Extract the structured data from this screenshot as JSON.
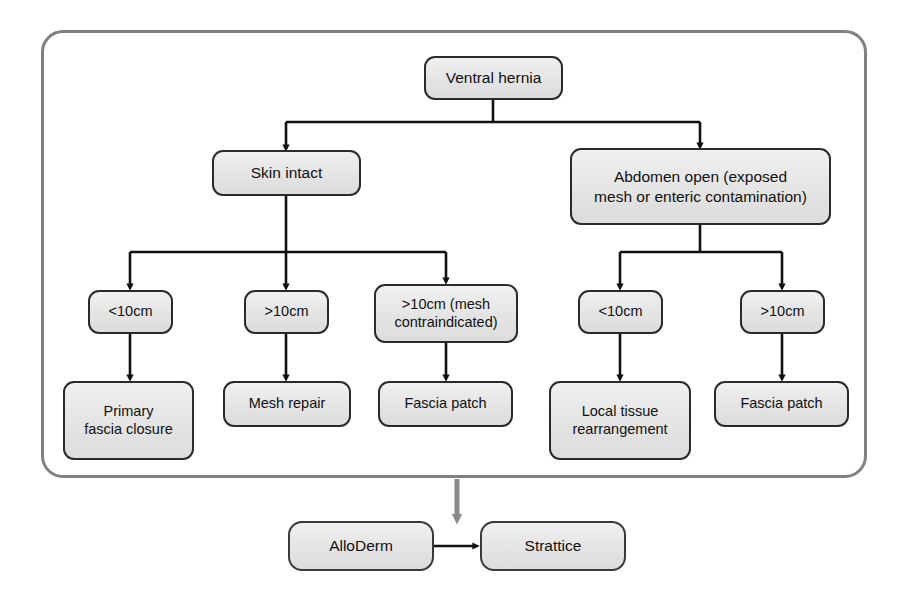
{
  "diagram": {
    "root": {
      "id": "ventral-hernia",
      "label": "Ventral hernia"
    },
    "level2": [
      {
        "id": "skin-intact",
        "label": "Skin intact"
      },
      {
        "id": "abdomen-open",
        "label": "Abdomen open (exposed\nmesh or enteric contamination)"
      }
    ],
    "level3": [
      {
        "id": "left-lt10",
        "label": "<10cm"
      },
      {
        "id": "left-gt10",
        "label": ">10cm"
      },
      {
        "id": "left-gt10-mesh-contraindicated",
        "label": ">10cm (mesh\ncontraindicated)"
      },
      {
        "id": "right-lt10",
        "label": "<10cm"
      },
      {
        "id": "right-gt10",
        "label": ">10cm"
      }
    ],
    "level4": [
      {
        "id": "primary-fascia-closure",
        "label": "Primary\nfascia closure"
      },
      {
        "id": "mesh-repair",
        "label": "Mesh repair"
      },
      {
        "id": "fascia-patch-left",
        "label": "Fascia patch"
      },
      {
        "id": "local-tissue-rearrangement",
        "label": "Local tissue\nrearrangement"
      },
      {
        "id": "fascia-patch-right",
        "label": "Fascia patch"
      }
    ],
    "products": [
      {
        "id": "alloderm",
        "label": "AlloDerm"
      },
      {
        "id": "strattice",
        "label": "Strattice"
      }
    ],
    "colors": {
      "node_border": "#2b2b2b",
      "node_fill": "#e4e4e4",
      "container_border": "#808080",
      "connector": "#111111",
      "product_connector": "#808080",
      "background": "#ffffff"
    }
  }
}
